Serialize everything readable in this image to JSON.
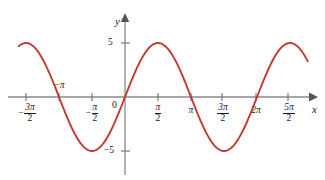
{
  "figure": {
    "title": "",
    "background_color": "#ffffff",
    "width": 325,
    "height": 180
  },
  "axes": {
    "x_axis_label": "x",
    "y_axis_label": "y",
    "axis_color": "#8a8a8a",
    "origin_label": "0"
  },
  "x_ticks": [
    {
      "id": "neg-3pi-2",
      "value": -4.712,
      "numerator": "3π",
      "denominator": "2",
      "negative": true,
      "plain": "−3π/2",
      "px": 26
    },
    {
      "id": "neg-pi",
      "value": -3.1416,
      "plain": "−π",
      "label_simple": "−π",
      "px": 59
    },
    {
      "id": "neg-pi-2",
      "value": -1.5708,
      "numerator": "π",
      "denominator": "2",
      "negative": true,
      "plain": "−π/2",
      "px": 92
    },
    {
      "id": "zero",
      "value": 0,
      "plain": "0",
      "label_simple": "0",
      "px": 125
    },
    {
      "id": "pi-2",
      "value": 1.5708,
      "numerator": "π",
      "denominator": "2",
      "negative": false,
      "plain": "π/2",
      "px": 158
    },
    {
      "id": "pi",
      "value": 3.1416,
      "plain": "π",
      "label_simple": "π",
      "px": 191
    },
    {
      "id": "3pi-2",
      "value": 4.712,
      "numerator": "3π",
      "denominator": "2",
      "negative": false,
      "plain": "3π/2",
      "px": 222
    },
    {
      "id": "2pi",
      "value": 6.2832,
      "plain": "2π",
      "label_simple": "2π",
      "px": 256
    },
    {
      "id": "5pi-2",
      "value": 7.854,
      "numerator": "5π",
      "denominator": "2",
      "negative": false,
      "plain": "5π/2",
      "px": 288
    }
  ],
  "y_ticks": [
    {
      "id": "y-pos-5",
      "value": 5,
      "label": "5",
      "px": 43
    },
    {
      "id": "y-neg-5",
      "value": -5,
      "label": "−5",
      "px": 151
    }
  ],
  "chart_data": {
    "type": "line",
    "title": "",
    "subtitle": "",
    "xlabel": "x",
    "ylabel": "y",
    "grid": false,
    "legend": false,
    "legend_position": "none",
    "xlim": [
      -5.25,
      9.0
    ],
    "ylim": [
      -7.0,
      7.0
    ],
    "xtick_values": [
      -4.712,
      -3.1416,
      -1.5708,
      0,
      1.5708,
      3.1416,
      4.712,
      6.2832,
      7.854
    ],
    "xtick_labels": [
      "−3π/2",
      "−π",
      "−π/2",
      "0",
      "π/2",
      "π",
      "3π/2",
      "2π",
      "5π/2"
    ],
    "ytick_values": [
      5,
      -5
    ],
    "ytick_labels": [
      "5",
      "−5"
    ],
    "series": [
      {
        "name": "y = -5 sin(x)",
        "color": "#bf3a30",
        "linewidth": 1.9,
        "expression": "y = -5*sin(x)",
        "amplitude": 5,
        "period": 6.2832,
        "x_domain": [
          -5.05,
          8.7
        ],
        "key_points": [
          {
            "label": "minimum",
            "x": -4.712,
            "y": -5
          },
          {
            "label": "x-intercept",
            "x": -3.1416,
            "y": 0
          },
          {
            "label": "maximum",
            "x": -1.5708,
            "y": 5
          },
          {
            "label": "x-intercept",
            "x": 0,
            "y": 0
          },
          {
            "label": "minimum",
            "x": 1.5708,
            "y": -5
          },
          {
            "label": "x-intercept",
            "x": 3.1416,
            "y": 0
          },
          {
            "label": "maximum",
            "x": 4.712,
            "y": 5
          },
          {
            "label": "x-intercept",
            "x": 6.2832,
            "y": 0
          },
          {
            "label": "minimum",
            "x": 7.854,
            "y": -5
          }
        ]
      }
    ]
  }
}
